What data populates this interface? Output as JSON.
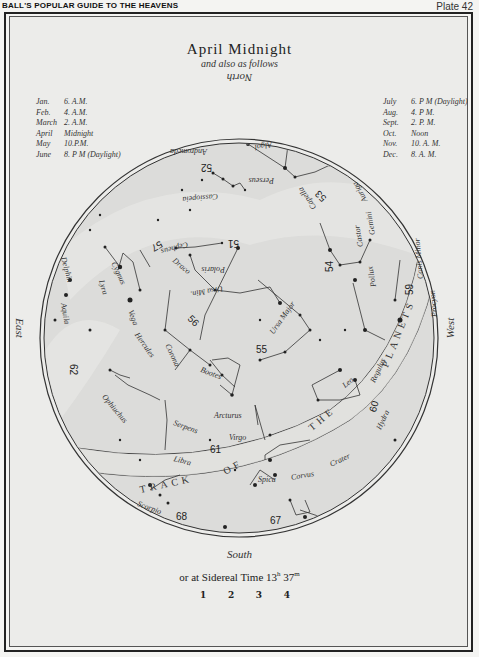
{
  "header": {
    "book_title": "BALL'S POPULAR GUIDE TO THE HEAVENS",
    "plate": "Plate 42"
  },
  "chart": {
    "title": "April Midnight",
    "subtitle": "and also as follows",
    "north": "North",
    "south": "South",
    "east": "East",
    "west": "West",
    "sidereal_prefix": "or at Sidereal Time 13",
    "sidereal_h": "h",
    "sidereal_min": " 37",
    "sidereal_m": "m",
    "magnitude_key": [
      "1",
      "2",
      "3",
      "4"
    ]
  },
  "times_left": [
    {
      "month": "Jan.",
      "time": "6. A.M."
    },
    {
      "month": "Feb.",
      "time": "4. A.M."
    },
    {
      "month": "March",
      "time": "2. A.M."
    },
    {
      "month": "April",
      "time": "Midnight"
    },
    {
      "month": "May",
      "time": "10.P.M."
    },
    {
      "month": "June",
      "time": "8. P M (Daylight)"
    }
  ],
  "times_right": [
    {
      "month": "July",
      "time": "6. P M (Daylight)"
    },
    {
      "month": "Aug.",
      "time": "4. P M."
    },
    {
      "month": "Sept.",
      "time": "2. P. M."
    },
    {
      "month": "Oct.",
      "time": "Noon"
    },
    {
      "month": "Nov.",
      "time": "10. A. M."
    },
    {
      "month": "Dec.",
      "time": "8. A. M."
    }
  ],
  "constellations": {
    "andromeda": "Andromeda",
    "algol": "Algol",
    "cassiopeia": "Cassiopeia",
    "perseus": "Perseus",
    "capella": "Capella",
    "auriga": "Auriga",
    "cepheus": "Cepheus",
    "polaris": "Polaris",
    "ursa_min": "Ursa Min.",
    "gemini": "Gemini",
    "castor": "Castor",
    "pollux": "Pollux",
    "canis_minor": "Canis Minor",
    "procyon": "Procyon",
    "cygnus": "Cygnus",
    "delphin": "Delphin",
    "draco": "Draco",
    "ursa_major": "Ursa Major",
    "lyra": "Lyra",
    "vega": "Vega",
    "aquila": "Aquila",
    "hercules": "Hercules",
    "corona": "Corona",
    "bootes": "Bootes",
    "leo": "Leo",
    "regulus": "Regulus",
    "ophiuchus": "Ophiuchus",
    "arcturus": "Arcturus",
    "serpens": "Serpens",
    "virgo": "Virgo",
    "hydra": "Hydra",
    "libra": "Libra",
    "spica": "Spica",
    "corvus": "Corvus",
    "crater": "Crater",
    "scorpio": "Scorpio"
  },
  "track_label": "TRACK OF THE PLANETS",
  "map_numbers": [
    "51",
    "52",
    "53",
    "54",
    "55",
    "56",
    "57",
    "59",
    "60",
    "61",
    "62",
    "67",
    "68"
  ]
}
